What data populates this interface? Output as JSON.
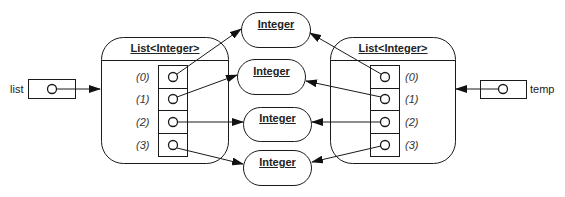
{
  "diagram": {
    "variables": [
      {
        "name": "list",
        "points_to": "left_list"
      },
      {
        "name": "temp",
        "points_to": "right_list"
      }
    ],
    "left_list": {
      "title": "List<Integer>",
      "indices": [
        "(0)",
        "(1)",
        "(2)",
        "(3)"
      ]
    },
    "right_list": {
      "title": "List<Integer>",
      "indices": [
        "(0)",
        "(1)",
        "(2)",
        "(3)"
      ]
    },
    "integers": [
      {
        "label": "Integer"
      },
      {
        "label": "Integer"
      },
      {
        "label": "Integer"
      },
      {
        "label": "Integer"
      }
    ],
    "edges": [
      "list -> left_list",
      "temp -> right_list",
      "left_list(0) -> integer 1",
      "left_list(1) -> integer 2",
      "left_list(2) -> integer 3",
      "left_list(3) -> integer 4",
      "right_list(0) -> integer 1",
      "right_list(1) -> integer 2",
      "right_list(2) -> integer 3",
      "right_list(3) -> integer 4"
    ],
    "colors": {
      "stroke": "#1a1a1a",
      "background": "#ffffff"
    }
  }
}
